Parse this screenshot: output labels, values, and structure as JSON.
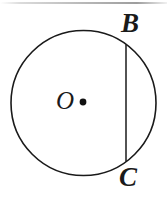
{
  "figure": {
    "kind": "geometry-diagram",
    "background_color": "#ffffff",
    "stroke_color": "#1a1a1a",
    "width": 167,
    "height": 197,
    "labels": {
      "center": "O",
      "chord_top": "B",
      "chord_bottom": "C"
    },
    "circle": {
      "center_x": 83.5,
      "center_y": 103,
      "radius": 72.5,
      "stroke_width": 1.6
    },
    "center_dot": {
      "x": 83,
      "y": 102,
      "radius": 3.4
    },
    "chord": {
      "x": 126,
      "y_top": 45,
      "y_bottom": 161,
      "stroke_width": 1.5
    },
    "top_rule": {
      "visible": true,
      "color": "#a0a0a0"
    }
  }
}
